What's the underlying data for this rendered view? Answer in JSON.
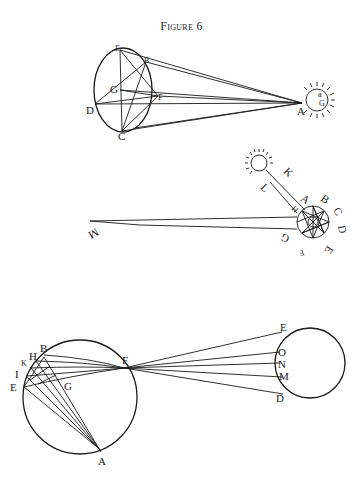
{
  "figure": {
    "title": "Figure 6"
  },
  "diagrams": {
    "top": {
      "description": "Sun rays converging from ellipse to sun point A",
      "labels": {
        "E": "E",
        "B": "B",
        "G": "G",
        "F": "F",
        "D": "D",
        "C": "C",
        "A": "A",
        "sun_G": "G",
        "sun_a": "a"
      }
    },
    "middle": {
      "description": "Small sun casting beam KL onto octagram circle with long shadow to M",
      "labels": {
        "K": "K",
        "L": "L",
        "H": "H",
        "A": "A",
        "B": "B",
        "C": "C",
        "D": "D",
        "E": "E",
        "F": "F",
        "G": "G",
        "M": "M"
      }
    },
    "bottom": {
      "description": "Rays from circle arc through point F to second circle",
      "left_labels": {
        "B": "B",
        "H": "H",
        "K": "K",
        "I": "I",
        "E": "E",
        "G": "G",
        "A": "A",
        "F": "F"
      },
      "right_labels": {
        "E": "E",
        "O": "O",
        "N": "N",
        "M": "M",
        "D": "D"
      }
    }
  }
}
